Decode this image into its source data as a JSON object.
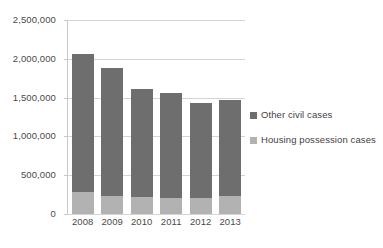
{
  "chart_data": {
    "type": "bar",
    "stacked": true,
    "title": "",
    "xlabel": "",
    "ylabel": "",
    "categories": [
      "2008",
      "2009",
      "2010",
      "2011",
      "2012",
      "2013"
    ],
    "series": [
      {
        "name": "Other civil cases",
        "color": "#6e6e6e",
        "values": [
          1770000,
          1650000,
          1395000,
          1345000,
          1225000,
          1245000
        ]
      },
      {
        "name": "Housing possession cases",
        "color": "#b2b2b2",
        "values": [
          290000,
          230000,
          215000,
          210000,
          205000,
          230000
        ]
      }
    ],
    "totals": [
      2060000,
      1880000,
      1610000,
      1555000,
      1430000,
      1475000
    ],
    "ylim": [
      0,
      2500000
    ],
    "ytick_values": [
      2500000,
      2000000,
      1500000,
      1000000,
      500000,
      0
    ],
    "ytick_labels": [
      "2,500,000",
      "2,000,000",
      "1,500,000",
      "1,000,000",
      "500,000",
      "0"
    ],
    "grid": true,
    "legend_position": "right"
  },
  "legend": {
    "items": [
      {
        "label": "Other civil cases",
        "color": "#6e6e6e"
      },
      {
        "label": "Housing possession cases",
        "color": "#b2b2b2"
      }
    ]
  },
  "colors": {
    "other_civil": "#6e6e6e",
    "housing_possession": "#b2b2b2",
    "gridline": "#d4d4d4",
    "text": "#4a4a4a",
    "background": "#ffffff"
  }
}
